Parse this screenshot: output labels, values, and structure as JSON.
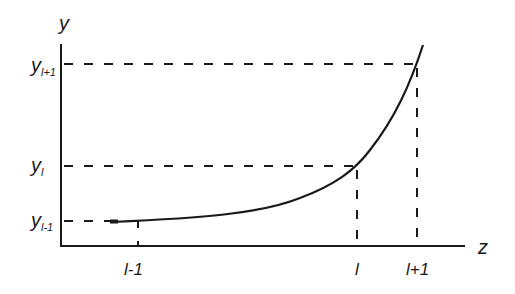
{
  "diagram": {
    "axes": {
      "y_label": "y",
      "x_label": "z"
    },
    "y_ticks": [
      {
        "main": "y",
        "sub": "l+1"
      },
      {
        "main": "y",
        "sub": "l"
      },
      {
        "main": "y",
        "sub": "l-1"
      }
    ],
    "x_ticks": [
      "l-1",
      "l",
      "l+1"
    ],
    "colors": {
      "ink": "#1a1a1a",
      "background": "#ffffff"
    }
  }
}
